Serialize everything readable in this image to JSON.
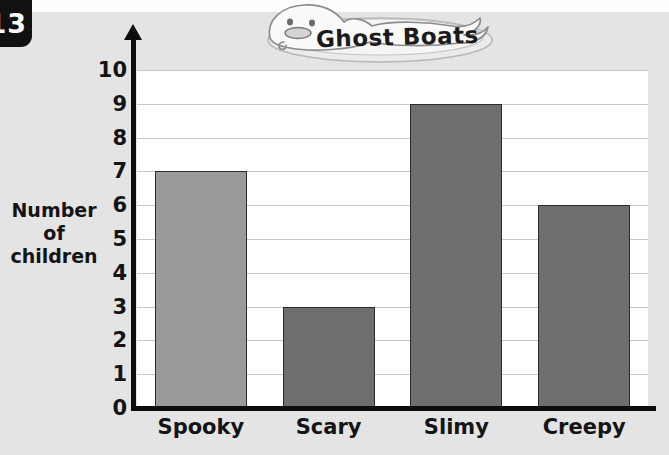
{
  "page": {
    "number": "13",
    "background_color": "#e4e4e4"
  },
  "chart_data": {
    "type": "bar",
    "title": "Ghost Boats",
    "xlabel": "",
    "ylabel": "Number of children",
    "ylabel_lines": [
      "Number",
      "of",
      "children"
    ],
    "categories": [
      "Spooky",
      "Scary",
      "Slimy",
      "Creepy"
    ],
    "values": [
      7,
      3,
      9,
      6
    ],
    "ylim": [
      0,
      10
    ],
    "ytick_labels": [
      "10",
      "9",
      "8",
      "7",
      "6",
      "5",
      "4",
      "3",
      "2",
      "1",
      "0"
    ],
    "grid": true,
    "legend": "none",
    "bar_colors": [
      "#9a9a9a",
      "#6e6e6e",
      "#6e6e6e",
      "#6e6e6e"
    ],
    "bar_border_color": "#2b2b2b",
    "plot_background": "#ffffff",
    "gridline_color": "#c9c9c9",
    "axis_color": "#0d0d0d"
  },
  "illustration": {
    "name": "ghost-drawing",
    "description": "hand-drawn ghost on a plate"
  }
}
